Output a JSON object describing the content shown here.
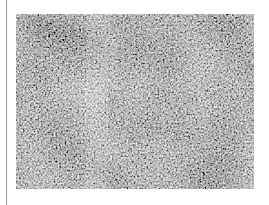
{
  "figure": {
    "colors": {
      "background": "#ffffff",
      "divider": "#9a9a9a",
      "texture_dark": "#2a2a2a",
      "texture_mid": "#7a7a7a",
      "texture_light": "#d8d8d8"
    }
  }
}
